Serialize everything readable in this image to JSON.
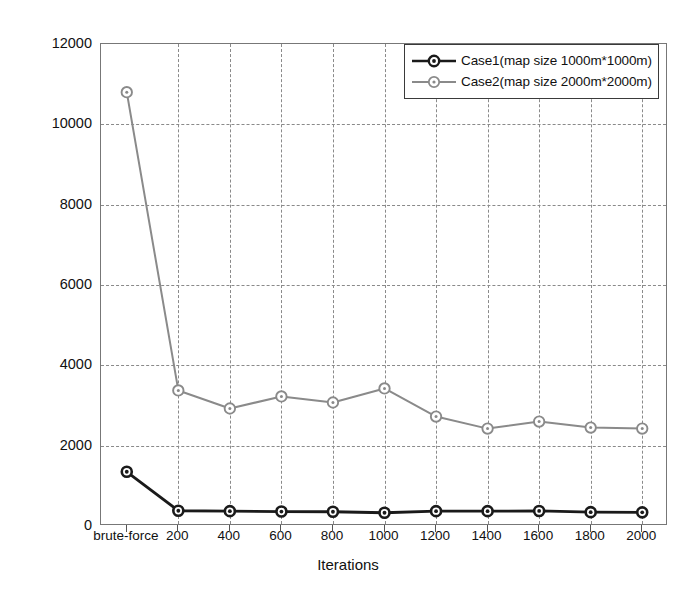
{
  "chart_data": {
    "type": "line",
    "title": "",
    "xlabel": "Iterations",
    "ylabel": "Average cost",
    "categories": [
      "brute-force",
      "200",
      "400",
      "600",
      "800",
      "1000",
      "1200",
      "1400",
      "1600",
      "1800",
      "2000"
    ],
    "x_tick_labels": [
      "brute-force",
      "200",
      "400",
      "600",
      "800",
      "1000",
      "1200",
      "1400",
      "1600",
      "1800",
      "2000"
    ],
    "y_tick_labels": [
      "0",
      "2000",
      "4000",
      "6000",
      "8000",
      "10000",
      "12000"
    ],
    "y_ticks": [
      0,
      2000,
      4000,
      6000,
      8000,
      10000,
      12000
    ],
    "ylim": [
      0,
      12000
    ],
    "grid": true,
    "grid_style": "dashed",
    "legend_position": "top-right",
    "series": [
      {
        "name": "Case1(map size 1000m*1000m)",
        "color": "#1a1a1a",
        "marker": "circle-filled",
        "values": [
          1350,
          380,
          370,
          360,
          355,
          330,
          370,
          370,
          375,
          345,
          340
        ]
      },
      {
        "name": "Case2(map size 2000m*2000m)",
        "color": "#8a8a8a",
        "marker": "circle-open",
        "values": [
          10800,
          3375,
          2925,
          3225,
          3075,
          3425,
          2725,
          2425,
          2600,
          2450,
          2425
        ]
      }
    ]
  },
  "legend": {
    "entries": [
      {
        "label": "Case1(map size 1000m*1000m)",
        "color": "#1a1a1a"
      },
      {
        "label": "Case2(map size 2000m*2000m)",
        "color": "#8a8a8a"
      }
    ]
  },
  "axes": {
    "x_title": "Iterations",
    "y_title": "Average cost"
  }
}
